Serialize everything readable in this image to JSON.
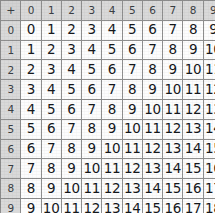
{
  "table": {
    "operator_symbol": "+",
    "column_headers": [
      "0",
      "1",
      "2",
      "3",
      "4",
      "5",
      "6",
      "7",
      "8",
      "9",
      "10"
    ],
    "row_headers": [
      "0",
      "1",
      "2",
      "3",
      "4",
      "5",
      "6",
      "7",
      "8",
      "9",
      "10"
    ],
    "rows": [
      {
        "header": "0",
        "cells": [
          "0",
          "1",
          "2",
          "3",
          "4",
          "5",
          "6",
          "7",
          "8",
          "9",
          "10"
        ]
      },
      {
        "header": "1",
        "cells": [
          "1",
          "2",
          "3",
          "4",
          "5",
          "6",
          "7",
          "8",
          "9",
          "10",
          "11"
        ]
      },
      {
        "header": "2",
        "cells": [
          "2",
          "3",
          "4",
          "5",
          "6",
          "7",
          "8",
          "9",
          "10",
          "11",
          "12"
        ]
      },
      {
        "header": "3",
        "cells": [
          "3",
          "4",
          "5",
          "6",
          "7",
          "8",
          "9",
          "10",
          "11",
          "12",
          "13"
        ]
      },
      {
        "header": "4",
        "cells": [
          "4",
          "5",
          "6",
          "7",
          "8",
          "9",
          "10",
          "11",
          "12",
          "13",
          "14"
        ]
      },
      {
        "header": "5",
        "cells": [
          "5",
          "6",
          "7",
          "8",
          "9",
          "10",
          "11",
          "12",
          "13",
          "14",
          "15"
        ]
      },
      {
        "header": "6",
        "cells": [
          "6",
          "7",
          "8",
          "9",
          "10",
          "11",
          "12",
          "13",
          "14",
          "15",
          "16"
        ]
      },
      {
        "header": "7",
        "cells": [
          "7",
          "8",
          "9",
          "10",
          "11",
          "12",
          "13",
          "14",
          "15",
          "16",
          "17"
        ]
      },
      {
        "header": "8",
        "cells": [
          "8",
          "9",
          "10",
          "11",
          "12",
          "13",
          "14",
          "15",
          "16",
          "17",
          "18"
        ]
      },
      {
        "header": "9",
        "cells": [
          "9",
          "10",
          "11",
          "12",
          "13",
          "14",
          "15",
          "16",
          "17",
          "18",
          "19"
        ]
      },
      {
        "header": "10",
        "cells": [
          "10",
          "11",
          "12",
          "13",
          "14",
          "15",
          "16",
          "17",
          "18",
          "19",
          "20"
        ]
      }
    ],
    "colors": {
      "header_background": "#d9d9d9",
      "cell_background": "#fdfdfd",
      "grid_line": "#8e8e8e",
      "text": "#15181c",
      "header_text": "#3b3f44"
    }
  }
}
